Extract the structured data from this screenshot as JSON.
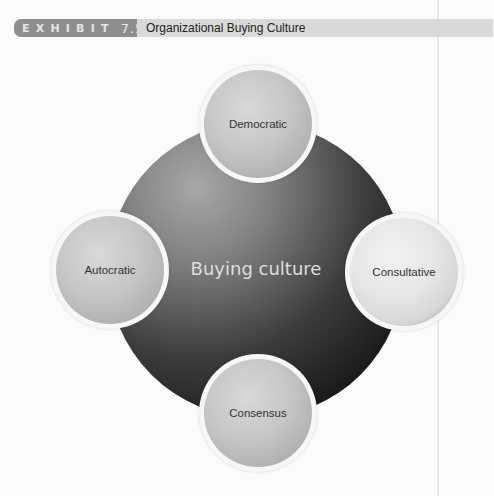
{
  "header": {
    "exhibit_label": "EXHIBIT",
    "exhibit_number": "7.5",
    "title": "Organizational Buying Culture"
  },
  "diagram": {
    "center_label": "Buying culture",
    "nodes": [
      {
        "position": "top",
        "label": "Democratic"
      },
      {
        "position": "left",
        "label": "Autocratic"
      },
      {
        "position": "right",
        "label": "Consultative"
      },
      {
        "position": "bottom",
        "label": "Consensus"
      }
    ]
  },
  "colors": {
    "badge_bg": "#8e8e8e",
    "title_bar_bg": "#d9d9d9",
    "hub_dark": "#111111",
    "hub_light": "#a8a8a8",
    "node_fill": "#c6c6c6",
    "center_text": "#dedede"
  }
}
